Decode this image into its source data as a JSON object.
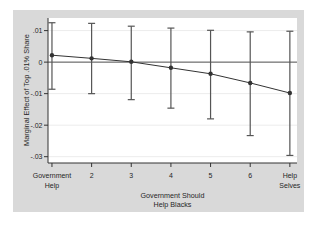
{
  "chart_data": {
    "type": "line",
    "title": "",
    "xlabel": "Government Should Help Blacks",
    "xlabel_lines": [
      "Government Should",
      "Help Blacks"
    ],
    "ylabel": "Marginal Effect of Top .01% Share",
    "x": [
      1,
      2,
      3,
      4,
      5,
      6,
      7
    ],
    "x_tick_labels": [
      [
        "Government",
        "Help"
      ],
      [
        "2"
      ],
      [
        "3"
      ],
      [
        "4"
      ],
      [
        "5"
      ],
      [
        "6"
      ],
      [
        "Help",
        "Selves"
      ]
    ],
    "y_ticks": [
      0.01,
      0,
      -0.01,
      -0.02,
      -0.03
    ],
    "y_tick_labels": [
      ".01",
      "0",
      "-.01",
      "-.02",
      "-.03"
    ],
    "series": [
      {
        "name": "marginal_effect",
        "values": [
          0.0022,
          0.0012,
          0.0001,
          -0.0018,
          -0.0037,
          -0.0066,
          -0.0098
        ],
        "ci_low": [
          -0.0086,
          -0.01,
          -0.0119,
          -0.0146,
          -0.018,
          -0.0233,
          -0.0296
        ],
        "ci_high": [
          0.0125,
          0.0123,
          0.0114,
          0.0108,
          0.0101,
          0.0096,
          0.0098
        ]
      }
    ],
    "xlim": [
      0.9,
      7.18
    ],
    "ylim": [
      -0.032,
      0.014
    ],
    "zero_line": true,
    "grid": "horizontal",
    "legend": "none",
    "colors": {
      "figure_bg": "#d9d9d9",
      "plot_bg": "#ffffff",
      "grid": "#ececec",
      "axis": "#333333",
      "zero_line": "#555555",
      "error_bar": "#555555",
      "series": "#333333",
      "text": "#262626"
    }
  }
}
